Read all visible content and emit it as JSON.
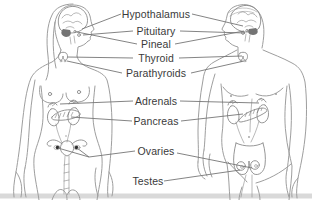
{
  "diagram": {
    "type": "endocrine-system-diagram",
    "canvas": {
      "width": 312,
      "height": 200
    },
    "figures": [
      {
        "id": "female-figure",
        "sex": "female",
        "side": "left",
        "organs_shown": [
          "brain",
          "hypothalamus",
          "pituitary",
          "pineal",
          "thyroid",
          "parathyroids",
          "adrenal glands",
          "kidneys",
          "pancreas",
          "uterus",
          "ovaries"
        ]
      },
      {
        "id": "male-figure",
        "sex": "male",
        "side": "right",
        "organs_shown": [
          "brain",
          "hypothalamus",
          "pituitary",
          "pineal",
          "thyroid",
          "parathyroids",
          "adrenal glands",
          "kidneys",
          "pancreas",
          "testes"
        ]
      }
    ],
    "labels": [
      {
        "id": "hypothalamus",
        "text": "Hypothalamus",
        "x": 156,
        "y": 14,
        "lines": [
          [
            [
              121,
              14
            ],
            [
              82,
              29
            ]
          ],
          [
            [
              192,
              14
            ],
            [
              243,
              26
            ]
          ]
        ]
      },
      {
        "id": "pituitary",
        "text": "Pituitary",
        "x": 156,
        "y": 31,
        "lines": [
          [
            [
              133,
              31
            ],
            [
              83,
              35
            ]
          ],
          [
            [
              180,
              31
            ],
            [
              245,
              33
            ]
          ]
        ]
      },
      {
        "id": "pineal",
        "text": "Pineal",
        "x": 156,
        "y": 44,
        "lines": [
          [
            [
              137,
              44
            ],
            [
              77,
              32
            ]
          ],
          [
            [
              175,
              44
            ],
            [
              244,
              31
            ]
          ]
        ]
      },
      {
        "id": "thyroid",
        "text": "Thyroid",
        "x": 156,
        "y": 58,
        "lines": [
          [
            [
              133,
              58
            ],
            [
              67,
              57
            ]
          ],
          [
            [
              179,
              58
            ],
            [
              242,
              56
            ]
          ]
        ]
      },
      {
        "id": "parathyroids",
        "text": "Parathyroids",
        "x": 156,
        "y": 73,
        "lines": [
          [
            [
              122,
              73
            ],
            [
              67,
              61
            ]
          ],
          [
            [
              191,
              73
            ],
            [
              244,
              61
            ]
          ]
        ]
      },
      {
        "id": "adrenals",
        "text": "Adrenals",
        "x": 156,
        "y": 101,
        "lines": [
          [
            [
              133,
              101
            ],
            [
              60,
              104
            ]
          ],
          [
            [
              180,
              101
            ],
            [
              259,
              103
            ]
          ]
        ]
      },
      {
        "id": "pancreas",
        "text": "Pancreas",
        "x": 156,
        "y": 121,
        "lines": [
          [
            [
              132,
              121
            ],
            [
              71,
              117
            ]
          ],
          [
            [
              181,
              121
            ],
            [
              243,
              114
            ]
          ]
        ]
      },
      {
        "id": "ovaries",
        "text": "Ovaries",
        "x": 156,
        "y": 151,
        "lines": [
          [
            [
              135,
              151
            ],
            [
              89,
              157
            ],
            [
              77,
              148
            ]
          ],
          [
            [
              89,
              157
            ],
            [
              58,
              148
            ]
          ],
          [
            [
              177,
              153
            ],
            [
              252,
              168
            ]
          ]
        ]
      },
      {
        "id": "testes",
        "text": "Testes",
        "x": 148,
        "y": 181,
        "lines": [
          [
            [
              164,
              181
            ],
            [
              240,
              170
            ]
          ]
        ]
      }
    ]
  },
  "colors": {
    "background": "#ffffff",
    "outline": "#9e9e9e",
    "organ": "#8a8a8a",
    "organ_dark": "#747474",
    "connector": "#767676",
    "label_text": "#3a3a3a",
    "ovary_dot": "#2f2f2f",
    "bottom_band": "#d9d9d9"
  }
}
